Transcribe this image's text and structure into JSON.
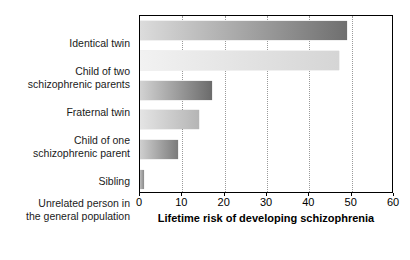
{
  "chart_data": {
    "type": "bar",
    "orientation": "horizontal",
    "title": "",
    "xlabel": "Lifetime risk of developing schizophrenia",
    "ylabel": "",
    "xlim": [
      0,
      60
    ],
    "xticks": [
      0,
      10,
      20,
      30,
      40,
      50,
      60
    ],
    "xtick_labels": [
      "0",
      "10",
      "20",
      "30",
      "40",
      "50",
      "60"
    ],
    "grid": "vertical-dotted",
    "legend": "none",
    "categories": [
      "Identical twin",
      "Child of two\nschizophrenic parents",
      "Fraternal twin",
      "Child of one\nschizophrenic parent",
      "Sibling",
      "Unrelated person in\nthe general population"
    ],
    "values": [
      49,
      47,
      17,
      14,
      9,
      1
    ],
    "bar_colors_start": [
      "#dcdcdc",
      "#f2f2f2",
      "#d2d2d2",
      "#e4e4e4",
      "#cfcfcf",
      "#bdbdbd"
    ],
    "bar_colors_end": [
      "#6f6f6f",
      "#d5d5d5",
      "#6b6b6b",
      "#b5b5b5",
      "#7b7b7b",
      "#8a8a8a"
    ]
  },
  "plot": {
    "x0": 0,
    "x1": 60,
    "pixel_width": 254,
    "pixel_height": 178
  }
}
